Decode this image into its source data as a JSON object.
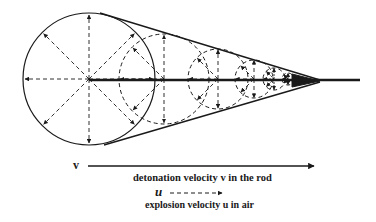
{
  "diagram": {
    "circles": [
      {
        "cx": 89,
        "cy": 79,
        "r": 66,
        "dashed": false
      },
      {
        "cx": 164,
        "cy": 79,
        "r": 45,
        "dashed": true
      },
      {
        "cx": 218,
        "cy": 79,
        "r": 30,
        "dashed": true
      },
      {
        "cx": 254,
        "cy": 79,
        "r": 19,
        "dashed": true
      },
      {
        "cx": 274,
        "cy": 79,
        "r": 11,
        "dashed": true
      },
      {
        "cx": 288,
        "cy": 79,
        "r": 6,
        "dashed": true
      }
    ],
    "rod": {
      "x1": 89,
      "x2": 360,
      "y": 80
    },
    "cone_tip": {
      "x": 320,
      "y": 81
    }
  },
  "legend": {
    "v_symbol": "v",
    "v_label": "detonation velocity v in the rod",
    "u_symbol": "u",
    "u_label": "explosion velocity u in air"
  }
}
